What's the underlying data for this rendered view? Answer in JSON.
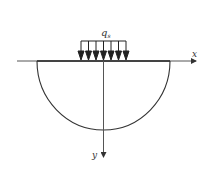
{
  "diagram": {
    "load_label": "q",
    "load_subscript": "s",
    "x_axis_label": "x",
    "y_axis_label": "y",
    "arrow_count": 7,
    "colors": {
      "line": "#333333",
      "background": "#ffffff"
    }
  }
}
